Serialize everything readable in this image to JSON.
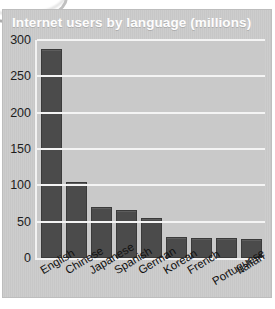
{
  "figure": {
    "title": "Internet users by language (millions)",
    "background_color": "#cbcbcb",
    "plot_background_color": "#c9c9c9",
    "gridline_color": "#f4f4f4",
    "bar_color": "#4b4b4b"
  },
  "chart_data": {
    "type": "bar",
    "title": "Internet users by language (millions)",
    "xlabel": "",
    "ylabel": "",
    "ylim": [
      0,
      300
    ],
    "yticks": [
      0,
      50,
      100,
      150,
      200,
      250,
      300
    ],
    "grid": true,
    "legend": false,
    "categories": [
      "English",
      "Chinese",
      "Japanese",
      "Spanish",
      "German",
      "Korean",
      "French",
      "Portuguese",
      "Italian"
    ],
    "values": [
      288,
      104,
      70,
      66,
      55,
      29,
      28,
      27,
      26
    ],
    "units": "millions of users"
  }
}
